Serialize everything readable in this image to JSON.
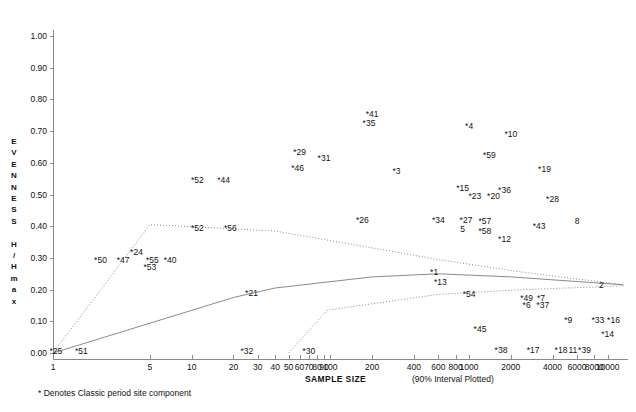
{
  "figure": {
    "caption": "* Denotes Classic period site component",
    "interval_note": "(90% Interval Plotted)"
  },
  "chart_data": {
    "type": "scatter",
    "title": "",
    "xlabel": "SAMPLE SIZE",
    "ylabel": "EVENNESS H / H max",
    "ylabel_chars": [
      "E",
      "V",
      "E",
      "N",
      "N",
      "E",
      "S",
      "S",
      "",
      "H",
      "/",
      "H",
      "m",
      "a",
      "x"
    ],
    "xscale": "log",
    "xlim": [
      1,
      14000
    ],
    "ylim": [
      0.0,
      1.05
    ],
    "grid": false,
    "legend": "none",
    "yticks": [
      0.0,
      0.1,
      0.2,
      0.3,
      0.4,
      0.5,
      0.6,
      0.7,
      0.8,
      0.9,
      1.0
    ],
    "ytick_labels": [
      "0.00",
      "0.10",
      "0.20",
      "0.30",
      "0.40",
      "0.50",
      "0.60",
      "0.70",
      "0.80",
      "0.90",
      "1.00"
    ],
    "xticks": [
      1,
      5,
      10,
      20,
      30,
      40,
      50,
      60,
      70,
      80,
      90,
      100,
      200,
      400,
      600,
      800,
      1000,
      2000,
      4000,
      6000,
      8000,
      10000
    ],
    "xtick_labels": [
      "1",
      "5",
      "10",
      "20",
      "30",
      "40",
      "50",
      "60",
      "70",
      "80",
      "90",
      "100",
      "200",
      "400",
      "600",
      "800",
      "1000",
      "2000",
      "4000",
      "6000",
      "8000",
      "10000"
    ],
    "points": [
      {
        "label": "*41",
        "x": 200,
        "y": 0.755
      },
      {
        "label": "*35",
        "x": 190,
        "y": 0.725
      },
      {
        "label": "*4",
        "x": 1000,
        "y": 0.715
      },
      {
        "label": "*10",
        "x": 2000,
        "y": 0.69
      },
      {
        "label": "*29",
        "x": 60,
        "y": 0.635
      },
      {
        "label": "*31",
        "x": 90,
        "y": 0.615
      },
      {
        "label": "*59",
        "x": 1400,
        "y": 0.625
      },
      {
        "label": "*46",
        "x": 58,
        "y": 0.585
      },
      {
        "label": "*3",
        "x": 300,
        "y": 0.575
      },
      {
        "label": "*19",
        "x": 3500,
        "y": 0.58
      },
      {
        "label": "*52",
        "x": 11,
        "y": 0.545
      },
      {
        "label": "*44",
        "x": 17,
        "y": 0.545
      },
      {
        "label": "*15",
        "x": 900,
        "y": 0.52
      },
      {
        "label": "*23",
        "x": 1100,
        "y": 0.495
      },
      {
        "label": "*36",
        "x": 1800,
        "y": 0.515
      },
      {
        "label": "*20",
        "x": 1500,
        "y": 0.495
      },
      {
        "label": "*28",
        "x": 4000,
        "y": 0.485
      },
      {
        "label": "*26",
        "x": 170,
        "y": 0.42
      },
      {
        "label": "*34",
        "x": 600,
        "y": 0.42
      },
      {
        "label": "*27",
        "x": 950,
        "y": 0.42
      },
      {
        "label": "*57",
        "x": 1300,
        "y": 0.415
      },
      {
        "label": "8",
        "x": 6000,
        "y": 0.415
      },
      {
        "label": "*52",
        "x": 11,
        "y": 0.395
      },
      {
        "label": "*56",
        "x": 19,
        "y": 0.395
      },
      {
        "label": "5",
        "x": 900,
        "y": 0.39
      },
      {
        "label": "*58",
        "x": 1300,
        "y": 0.385
      },
      {
        "label": "*43",
        "x": 3200,
        "y": 0.4
      },
      {
        "label": "*12",
        "x": 1800,
        "y": 0.36
      },
      {
        "label": "*24",
        "x": 4,
        "y": 0.32
      },
      {
        "label": "*50",
        "x": 2.2,
        "y": 0.295
      },
      {
        "label": "*47",
        "x": 3.2,
        "y": 0.295
      },
      {
        "label": "*55",
        "x": 5.2,
        "y": 0.295
      },
      {
        "label": "*40",
        "x": 7,
        "y": 0.295
      },
      {
        "label": "*53",
        "x": 5,
        "y": 0.27
      },
      {
        "label": "*1",
        "x": 560,
        "y": 0.255
      },
      {
        "label": "*13",
        "x": 620,
        "y": 0.225
      },
      {
        "label": "2",
        "x": 9000,
        "y": 0.215
      },
      {
        "label": "*21",
        "x": 27,
        "y": 0.19
      },
      {
        "label": "*54",
        "x": 1000,
        "y": 0.185
      },
      {
        "label": "*49",
        "x": 2600,
        "y": 0.175
      },
      {
        "label": "*7",
        "x": 3300,
        "y": 0.175
      },
      {
        "label": "*6",
        "x": 2600,
        "y": 0.15
      },
      {
        "label": "*37",
        "x": 3400,
        "y": 0.15
      },
      {
        "label": "*9",
        "x": 5200,
        "y": 0.105
      },
      {
        "label": "*33",
        "x": 8500,
        "y": 0.105
      },
      {
        "label": "*16",
        "x": 11000,
        "y": 0.105
      },
      {
        "label": "*14",
        "x": 10000,
        "y": 0.06
      },
      {
        "label": "*45",
        "x": 1200,
        "y": 0.075
      },
      {
        "label": "*25",
        "x": 1.05,
        "y": 0.005
      },
      {
        "label": "*51",
        "x": 1.6,
        "y": 0.005
      },
      {
        "label": "*32",
        "x": 25,
        "y": 0.005
      },
      {
        "label": "*30",
        "x": 70,
        "y": 0.005
      },
      {
        "label": "*38",
        "x": 1700,
        "y": 0.01
      },
      {
        "label": "*17",
        "x": 2900,
        "y": 0.01
      },
      {
        "label": "*18",
        "x": 4600,
        "y": 0.01
      },
      {
        "label": "11",
        "x": 5600,
        "y": 0.01
      },
      {
        "label": "*39",
        "x": 6800,
        "y": 0.01
      }
    ],
    "curves": [
      {
        "name": "upper-interval-bound",
        "style": "dotted",
        "points": [
          [
            1,
            0.0
          ],
          [
            5,
            0.405
          ],
          [
            40,
            0.385
          ],
          [
            600,
            0.295
          ],
          [
            2000,
            0.26
          ],
          [
            13000,
            0.215
          ]
        ]
      },
      {
        "name": "median-fit",
        "style": "solid",
        "points": [
          [
            1,
            0.0
          ],
          [
            20,
            0.175
          ],
          [
            40,
            0.205
          ],
          [
            200,
            0.24
          ],
          [
            600,
            0.25
          ],
          [
            2000,
            0.24
          ],
          [
            13000,
            0.215
          ]
        ]
      },
      {
        "name": "lower-interval-bound",
        "style": "dotted",
        "points": [
          [
            50,
            0.0
          ],
          [
            95,
            0.135
          ],
          [
            600,
            0.185
          ],
          [
            2000,
            0.198
          ],
          [
            13000,
            0.212
          ]
        ]
      }
    ]
  }
}
